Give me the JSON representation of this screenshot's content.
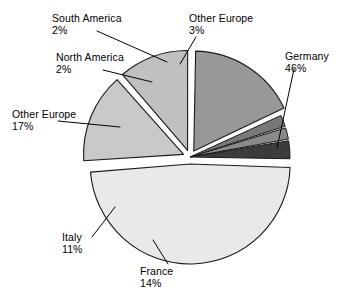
{
  "chart_data": {
    "type": "pie",
    "title": "",
    "subtitle": "",
    "xlabel": "",
    "ylabel": "",
    "legend_position": "none",
    "grid": false,
    "exploded_slices": [
      "Germany",
      "Other Europe (17%)",
      "Italy",
      "France"
    ],
    "categories": [
      "Germany",
      "France",
      "Italy",
      "Other Europe",
      "North America",
      "South America",
      "Other Europe"
    ],
    "values": [
      46,
      14,
      11,
      17,
      2,
      2,
      3
    ],
    "slices": [
      {
        "name": "Germany",
        "label": "Germany",
        "percent": 46,
        "percent_text": "46%",
        "color": "#e9e9e9",
        "start_angle": 2,
        "end_angle": 167.6,
        "exploded": true
      },
      {
        "name": "France",
        "label": "France",
        "percent": 14,
        "percent_text": "14%",
        "color": "#c9c9c9",
        "start_angle": 169.6,
        "end_angle": 220,
        "exploded": true
      },
      {
        "name": "Italy",
        "label": "Italy",
        "percent": 11,
        "percent_text": "11%",
        "color": "#c0c0c0",
        "start_angle": 222,
        "end_angle": 261.6,
        "exploded": true
      },
      {
        "name": "Other Europe 17",
        "label": "Other Europe",
        "percent": 17,
        "percent_text": "17%",
        "color": "#989898",
        "start_angle": 263.6,
        "end_angle": 324.8,
        "exploded": true
      },
      {
        "name": "North America",
        "label": "North America",
        "percent": 2,
        "percent_text": "2%",
        "color": "#787878",
        "start_angle": 325.8,
        "end_angle": 333,
        "exploded": false
      },
      {
        "name": "South America",
        "label": "South America",
        "percent": 2,
        "percent_text": "2%",
        "color": "#8a8a8a",
        "start_angle": 334,
        "end_angle": 341.2,
        "exploded": false
      },
      {
        "name": "Other Europe 3",
        "label": "Other Europe",
        "percent": 3,
        "percent_text": "3%",
        "color": "#3c3c3c",
        "start_angle": 342.2,
        "end_angle": 353,
        "exploded": false
      }
    ],
    "annotations": [
      {
        "name": "south-america",
        "label": "South America",
        "percent_text": "2%"
      },
      {
        "name": "other-europe-3",
        "label": "Other Europe",
        "percent_text": "3%"
      },
      {
        "name": "north-america",
        "label": "North America",
        "percent_text": "2%"
      },
      {
        "name": "germany",
        "label": "Germany",
        "percent_text": "46%"
      },
      {
        "name": "other-europe-17",
        "label": "Other Europe",
        "percent_text": "17%"
      },
      {
        "name": "italy",
        "label": "Italy",
        "percent_text": "11%"
      },
      {
        "name": "france",
        "label": "France",
        "percent_text": "14%"
      }
    ]
  },
  "labels": {
    "south_america": {
      "name": "South America",
      "pct": "2%"
    },
    "other_europe_3": {
      "name": "Other Europe",
      "pct": "3%"
    },
    "north_america": {
      "name": "North America",
      "pct": "2%"
    },
    "germany": {
      "name": "Germany",
      "pct": "46%"
    },
    "other_europe_17": {
      "name": "Other Europe",
      "pct": "17%"
    },
    "italy": {
      "name": "Italy",
      "pct": "11%"
    },
    "france": {
      "name": "France",
      "pct": "14%"
    }
  },
  "colors": {
    "germany": "#e9e9e9",
    "france": "#c9c9c9",
    "italy": "#c0c0c0",
    "other_europe_17": "#989898",
    "north_america": "#787878",
    "south_america": "#8a8a8a",
    "other_europe_3": "#3c3c3c",
    "outline": "#1a1a1a",
    "background": "#ffffff",
    "text": "#000000"
  }
}
